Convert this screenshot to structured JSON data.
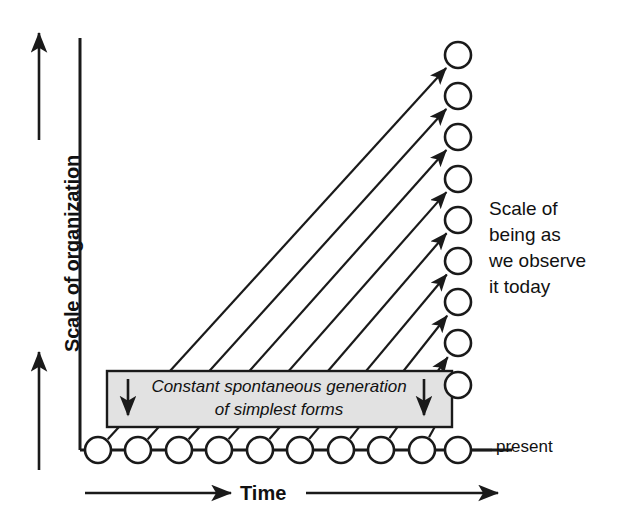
{
  "diagram": {
    "axes": {
      "y_label": "Scale of organization",
      "x_label": "Time",
      "y_arrow_direction": "up",
      "x_arrow_direction": "right"
    },
    "labels": {
      "present": "present",
      "side_note_lines": [
        "Scale of",
        "being as",
        "we observe",
        "it today"
      ],
      "box_line_1": "Constant spontaneous generation",
      "box_line_2": "of simplest forms"
    },
    "colors": {
      "stroke": "#1a1a1a",
      "box_fill": "#e2e2e2",
      "box_stroke": "#1a1a1a",
      "node_fill": "#ffffff",
      "background": "#ffffff",
      "text": "#111111"
    },
    "geometry": {
      "axis_origin_x": 80,
      "axis_origin_y": 450,
      "axis_top_y": 38,
      "baseline_y": 450,
      "baseline_first_x": 98,
      "baseline_spacing": 40.5,
      "baseline_node_count": 10,
      "column_x": 458,
      "column_first_y": 55,
      "column_spacing": 41.2,
      "column_node_count": 9,
      "node_radius": 13,
      "baseline_end_x": 512,
      "box": {
        "x": 107,
        "y": 371,
        "width": 345,
        "height": 56
      }
    }
  },
  "chart_data": {
    "type": "diagram",
    "xlabel": "Time",
    "ylabel": "Scale of organization",
    "baseline_nodes": [
      {
        "index": 1,
        "x": 98,
        "y": 450
      },
      {
        "index": 2,
        "x": 138,
        "y": 450
      },
      {
        "index": 3,
        "x": 179,
        "y": 450
      },
      {
        "index": 4,
        "x": 219,
        "y": 450
      },
      {
        "index": 5,
        "x": 260,
        "y": 450
      },
      {
        "index": 6,
        "x": 300,
        "y": 450
      },
      {
        "index": 7,
        "x": 341,
        "y": 450
      },
      {
        "index": 8,
        "x": 381,
        "y": 450
      },
      {
        "index": 9,
        "x": 422,
        "y": 450
      },
      {
        "index": 10,
        "x": 458,
        "y": 450
      }
    ],
    "column_nodes": [
      {
        "index": 1,
        "x": 458,
        "y": 55
      },
      {
        "index": 2,
        "x": 458,
        "y": 96
      },
      {
        "index": 3,
        "x": 458,
        "y": 137
      },
      {
        "index": 4,
        "x": 458,
        "y": 179
      },
      {
        "index": 5,
        "x": 458,
        "y": 220
      },
      {
        "index": 6,
        "x": 458,
        "y": 261
      },
      {
        "index": 7,
        "x": 458,
        "y": 302
      },
      {
        "index": 8,
        "x": 458,
        "y": 343
      },
      {
        "index": 9,
        "x": 458,
        "y": 385
      }
    ],
    "arrows": [
      {
        "from_index": 1,
        "to_index": 1
      },
      {
        "from_index": 2,
        "to_index": 2
      },
      {
        "from_index": 3,
        "to_index": 3
      },
      {
        "from_index": 4,
        "to_index": 4
      },
      {
        "from_index": 5,
        "to_index": 5
      },
      {
        "from_index": 6,
        "to_index": 6
      },
      {
        "from_index": 7,
        "to_index": 7
      },
      {
        "from_index": 8,
        "to_index": 8
      },
      {
        "from_index": 9,
        "to_index": 9
      }
    ],
    "annotations": [
      {
        "text": "Constant spontaneous generation of simplest forms",
        "style": "italic",
        "in_box": true
      },
      {
        "text": "Scale of being as we observe it today",
        "position": "right"
      },
      {
        "text": "present",
        "position": "baseline-right"
      }
    ]
  }
}
